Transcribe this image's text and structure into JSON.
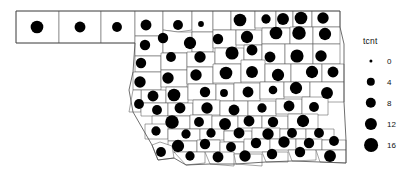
{
  "figure": {
    "kind": "proportional-symbol-map",
    "region": "Oklahoma counties",
    "background_color": "#ffffff",
    "county_stroke_color": "#5a5a5a",
    "symbol_color": "#000000"
  },
  "legend": {
    "title": "tcnt",
    "position": "right",
    "symbol_color": "#000000",
    "breaks": [
      {
        "label": "0",
        "value": 0,
        "radius_px": 1.6
      },
      {
        "label": "4",
        "value": 4,
        "radius_px": 4.2
      },
      {
        "label": "8",
        "value": 8,
        "radius_px": 5.2
      },
      {
        "label": "12",
        "value": 12,
        "radius_px": 6.1
      },
      {
        "label": "16",
        "value": 16,
        "radius_px": 6.9
      }
    ]
  },
  "chart_data": {
    "type": "scatter",
    "title": "",
    "xlabel": "",
    "ylabel": "",
    "legend_title": "tcnt",
    "legend_position": "right",
    "grid": false,
    "size_variable": "tcnt",
    "size_breaks": [
      0,
      4,
      8,
      12,
      16
    ],
    "points": [
      {
        "x": 37,
        "y": 27,
        "tcnt": 12
      },
      {
        "x": 80,
        "y": 27,
        "tcnt": 8
      },
      {
        "x": 117,
        "y": 27,
        "tcnt": 6
      },
      {
        "x": 146,
        "y": 25,
        "tcnt": 8
      },
      {
        "x": 178,
        "y": 25,
        "tcnt": 6
      },
      {
        "x": 201,
        "y": 24,
        "tcnt": 1
      },
      {
        "x": 240,
        "y": 20,
        "tcnt": 12
      },
      {
        "x": 266,
        "y": 19,
        "tcnt": 5
      },
      {
        "x": 283,
        "y": 19,
        "tcnt": 10
      },
      {
        "x": 301,
        "y": 18,
        "tcnt": 12
      },
      {
        "x": 323,
        "y": 18,
        "tcnt": 9
      },
      {
        "x": 145,
        "y": 45,
        "tcnt": 7
      },
      {
        "x": 163,
        "y": 38,
        "tcnt": 7
      },
      {
        "x": 190,
        "y": 43,
        "tcnt": 11
      },
      {
        "x": 218,
        "y": 39,
        "tcnt": 7
      },
      {
        "x": 247,
        "y": 37,
        "tcnt": 11
      },
      {
        "x": 276,
        "y": 33,
        "tcnt": 12
      },
      {
        "x": 299,
        "y": 33,
        "tcnt": 14
      },
      {
        "x": 325,
        "y": 34,
        "tcnt": 11
      },
      {
        "x": 141,
        "y": 63,
        "tcnt": 7
      },
      {
        "x": 171,
        "y": 57,
        "tcnt": 6
      },
      {
        "x": 200,
        "y": 57,
        "tcnt": 9
      },
      {
        "x": 232,
        "y": 53,
        "tcnt": 13
      },
      {
        "x": 252,
        "y": 50,
        "tcnt": 8
      },
      {
        "x": 270,
        "y": 57,
        "tcnt": 8
      },
      {
        "x": 297,
        "y": 56,
        "tcnt": 13
      },
      {
        "x": 321,
        "y": 56,
        "tcnt": 9
      },
      {
        "x": 140,
        "y": 82,
        "tcnt": 9
      },
      {
        "x": 168,
        "y": 78,
        "tcnt": 9
      },
      {
        "x": 196,
        "y": 75,
        "tcnt": 9
      },
      {
        "x": 226,
        "y": 73,
        "tcnt": 12
      },
      {
        "x": 252,
        "y": 72,
        "tcnt": 10
      },
      {
        "x": 278,
        "y": 75,
        "tcnt": 11
      },
      {
        "x": 312,
        "y": 72,
        "tcnt": 11
      },
      {
        "x": 333,
        "y": 72,
        "tcnt": 8
      },
      {
        "x": 153,
        "y": 96,
        "tcnt": 8
      },
      {
        "x": 139,
        "y": 104,
        "tcnt": 6
      },
      {
        "x": 174,
        "y": 95,
        "tcnt": 12
      },
      {
        "x": 205,
        "y": 92,
        "tcnt": 7
      },
      {
        "x": 224,
        "y": 93,
        "tcnt": 3
      },
      {
        "x": 248,
        "y": 92,
        "tcnt": 8
      },
      {
        "x": 273,
        "y": 90,
        "tcnt": 4
      },
      {
        "x": 296,
        "y": 88,
        "tcnt": 11
      },
      {
        "x": 327,
        "y": 93,
        "tcnt": 10
      },
      {
        "x": 157,
        "y": 110,
        "tcnt": 6
      },
      {
        "x": 180,
        "y": 108,
        "tcnt": 8
      },
      {
        "x": 207,
        "y": 108,
        "tcnt": 9
      },
      {
        "x": 234,
        "y": 110,
        "tcnt": 8
      },
      {
        "x": 262,
        "y": 108,
        "tcnt": 5
      },
      {
        "x": 289,
        "y": 106,
        "tcnt": 8
      },
      {
        "x": 314,
        "y": 107,
        "tcnt": 6
      },
      {
        "x": 172,
        "y": 122,
        "tcnt": 14
      },
      {
        "x": 199,
        "y": 122,
        "tcnt": 6
      },
      {
        "x": 225,
        "y": 124,
        "tcnt": 10
      },
      {
        "x": 249,
        "y": 121,
        "tcnt": 8
      },
      {
        "x": 273,
        "y": 122,
        "tcnt": 7
      },
      {
        "x": 303,
        "y": 121,
        "tcnt": 11
      },
      {
        "x": 156,
        "y": 131,
        "tcnt": 5
      },
      {
        "x": 186,
        "y": 134,
        "tcnt": 5
      },
      {
        "x": 211,
        "y": 133,
        "tcnt": 5
      },
      {
        "x": 239,
        "y": 133,
        "tcnt": 8
      },
      {
        "x": 268,
        "y": 134,
        "tcnt": 9
      },
      {
        "x": 292,
        "y": 133,
        "tcnt": 6
      },
      {
        "x": 319,
        "y": 133,
        "tcnt": 6
      },
      {
        "x": 178,
        "y": 146,
        "tcnt": 11
      },
      {
        "x": 205,
        "y": 144,
        "tcnt": 7
      },
      {
        "x": 231,
        "y": 147,
        "tcnt": 6
      },
      {
        "x": 256,
        "y": 143,
        "tcnt": 7
      },
      {
        "x": 284,
        "y": 142,
        "tcnt": 9
      },
      {
        "x": 309,
        "y": 143,
        "tcnt": 7
      },
      {
        "x": 334,
        "y": 141,
        "tcnt": 6
      },
      {
        "x": 161,
        "y": 152,
        "tcnt": 6
      },
      {
        "x": 190,
        "y": 156,
        "tcnt": 5
      },
      {
        "x": 218,
        "y": 157,
        "tcnt": 8
      },
      {
        "x": 245,
        "y": 156,
        "tcnt": 9
      },
      {
        "x": 272,
        "y": 154,
        "tcnt": 7
      },
      {
        "x": 300,
        "y": 152,
        "tcnt": 7
      },
      {
        "x": 330,
        "y": 156,
        "tcnt": 10
      }
    ]
  }
}
